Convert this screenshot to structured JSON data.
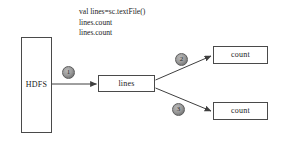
{
  "diagram": {
    "type": "flow-diagram",
    "background_color": "#ffffff",
    "stroke_color": "#4a4a4a",
    "badge_color": "#9a9a9a",
    "annotation": {
      "lines": [
        "val lines=sc.textFile()",
        "lines.count",
        "lines.count"
      ]
    },
    "nodes": [
      {
        "id": "hdfs",
        "label": "HDFS"
      },
      {
        "id": "lines",
        "label": "lines"
      },
      {
        "id": "count_top",
        "label": "count"
      },
      {
        "id": "count_bottom",
        "label": "count"
      }
    ],
    "steps": [
      {
        "id": "step1",
        "number": "1"
      },
      {
        "id": "step2",
        "number": "2"
      },
      {
        "id": "step3",
        "number": "3"
      }
    ],
    "edges": [
      {
        "from": "hdfs",
        "to": "lines",
        "step": "1"
      },
      {
        "from": "lines",
        "to": "count_top",
        "step": "2"
      },
      {
        "from": "lines",
        "to": "count_bottom",
        "step": "3"
      }
    ]
  }
}
